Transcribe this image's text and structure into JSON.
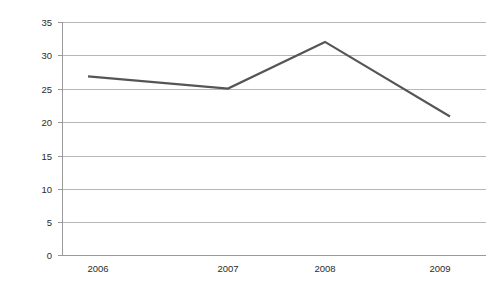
{
  "chart_data": {
    "type": "line",
    "title": "",
    "subtitle": "",
    "xlabel": "",
    "ylabel": "",
    "categories": [
      "2006",
      "2007",
      "2008",
      "2009"
    ],
    "values": [
      26.7,
      25.0,
      32.0,
      21.7
    ],
    "series": [
      {
        "name": "series-1",
        "values": [
          26.7,
          25.0,
          32.0,
          21.7
        ],
        "color": "#555555"
      }
    ],
    "ylim": [
      0,
      35
    ],
    "ytick_labels": [
      "0",
      "5",
      "10",
      "15",
      "20",
      "25",
      "30",
      "35"
    ],
    "ytick_values": [
      0,
      5,
      10,
      15,
      20,
      25,
      30,
      35
    ],
    "xtick_labels": [
      "2006",
      "2007",
      "2008",
      "2009"
    ],
    "grid": true,
    "grid_axis": "y",
    "legend": false,
    "legend_position": "none",
    "markers": false,
    "annotations": []
  },
  "style": {
    "background_color": "#ffffff",
    "grid_color": "#b7b7b7",
    "axis_color": "#9a9a9a",
    "line_color": "#555555",
    "text_color": "#2b2b2b"
  },
  "geometry": {
    "plot_left": 62,
    "plot_right": 486,
    "plot_top": 22,
    "plot_bottom": 255,
    "x_positions": [
      98,
      228,
      325,
      440
    ],
    "line_x_start": 88,
    "line_x_end": 450
  }
}
